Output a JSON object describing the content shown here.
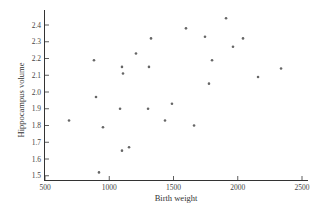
{
  "chart_data": {
    "type": "scatter",
    "title": "",
    "xlabel": "Birth weight",
    "ylabel": "Hippocampus volume",
    "xlim": [
      500,
      2500
    ],
    "ylim": [
      1.5,
      2.45
    ],
    "xticks": [
      500,
      1000,
      1500,
      2000,
      2500
    ],
    "xtick_labels": [
      "500",
      "1000",
      "1500",
      "2000",
      "2500"
    ],
    "yticks": [
      1.5,
      1.6,
      1.7,
      1.8,
      1.9,
      2.0,
      2.1,
      2.2,
      2.3,
      2.4
    ],
    "ytick_labels": [
      "1.5",
      "1.6",
      "1.7",
      "1.8",
      "1.9",
      "2.0",
      "2.1",
      "2.2",
      "2.3",
      "2.4"
    ],
    "grid": false,
    "legend": null,
    "marker_color": "#666666",
    "axis_color": "#333333",
    "points": [
      {
        "x": 687,
        "y": 1.83
      },
      {
        "x": 881,
        "y": 2.19
      },
      {
        "x": 897,
        "y": 1.97
      },
      {
        "x": 920,
        "y": 1.52
      },
      {
        "x": 951,
        "y": 1.79
      },
      {
        "x": 1084,
        "y": 1.9
      },
      {
        "x": 1099,
        "y": 2.15
      },
      {
        "x": 1107,
        "y": 2.11
      },
      {
        "x": 1099,
        "y": 1.65
      },
      {
        "x": 1154,
        "y": 1.67
      },
      {
        "x": 1208,
        "y": 2.23
      },
      {
        "x": 1309,
        "y": 2.15
      },
      {
        "x": 1325,
        "y": 2.32
      },
      {
        "x": 1302,
        "y": 1.9
      },
      {
        "x": 1434,
        "y": 1.83
      },
      {
        "x": 1488,
        "y": 1.93
      },
      {
        "x": 1597,
        "y": 2.38
      },
      {
        "x": 1660,
        "y": 1.8
      },
      {
        "x": 1745,
        "y": 2.33
      },
      {
        "x": 1776,
        "y": 2.05
      },
      {
        "x": 1800,
        "y": 2.19
      },
      {
        "x": 1909,
        "y": 2.44
      },
      {
        "x": 1963,
        "y": 2.27
      },
      {
        "x": 2041,
        "y": 2.32
      },
      {
        "x": 2158,
        "y": 2.09
      },
      {
        "x": 2337,
        "y": 2.14
      }
    ]
  }
}
